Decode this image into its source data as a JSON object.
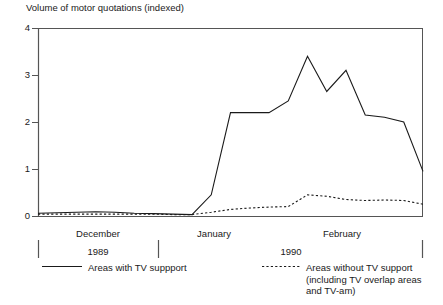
{
  "chart_data": {
    "type": "line",
    "title": "Volume of motor quotations (indexed)",
    "xlabel": "",
    "ylabel": "",
    "ylim": [
      0,
      4
    ],
    "xlim": [
      0,
      24
    ],
    "grid": false,
    "legend_position": "bottom",
    "y_ticks": [
      "0",
      "1",
      "2",
      "3",
      "4"
    ],
    "y_tick_values": [
      0,
      1,
      2,
      3,
      4
    ],
    "x_group_labels": [
      "December",
      "January",
      "February"
    ],
    "x_period_labels": [
      "1989",
      "1990"
    ],
    "series": [
      {
        "name": "Areas with TV suppport",
        "style": "solid",
        "x": [
          0,
          1,
          2,
          3,
          4,
          5,
          6,
          7,
          8,
          9,
          10,
          11,
          12,
          13,
          14,
          15,
          16,
          17,
          18,
          19,
          20
        ],
        "values": [
          0.06,
          0.07,
          0.08,
          0.09,
          0.08,
          0.06,
          0.05,
          0.04,
          0.03,
          0.45,
          2.2,
          2.2,
          2.2,
          2.45,
          3.4,
          2.65,
          3.1,
          2.15,
          2.1,
          2.0,
          0.95
        ]
      },
      {
        "name": "Areas without TV support\n(including TV overlap areas\nand TV-am)",
        "style": "dotted",
        "x": [
          0,
          1,
          2,
          3,
          4,
          5,
          6,
          7,
          8,
          9,
          10,
          11,
          12,
          13,
          14,
          15,
          16,
          17,
          18,
          19,
          20
        ],
        "values": [
          0.04,
          0.04,
          0.04,
          0.04,
          0.04,
          0.04,
          0.04,
          0.03,
          0.03,
          0.08,
          0.14,
          0.17,
          0.19,
          0.2,
          0.45,
          0.42,
          0.35,
          0.33,
          0.34,
          0.33,
          0.25
        ]
      }
    ]
  },
  "legend": {
    "entries": [
      {
        "label": "Areas with TV suppport",
        "style": "solid"
      },
      {
        "label": "Areas without TV support\n(including TV overlap areas\nand TV-am)",
        "style": "dotted"
      }
    ]
  },
  "axis": {
    "y_labels": [
      "4",
      "3",
      "2",
      "1",
      "0"
    ],
    "month_labels": [
      "December",
      "January",
      "February"
    ],
    "year_labels": [
      "1989",
      "1990"
    ]
  },
  "colors": {
    "line": "#1a1a1a",
    "axis": "#555555",
    "text": "#1a1a1a",
    "background": "#ffffff"
  }
}
